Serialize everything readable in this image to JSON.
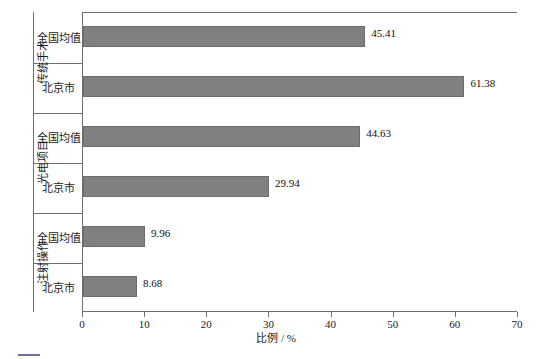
{
  "chart_data": {
    "type": "bar",
    "orientation": "horizontal",
    "title": "",
    "xlabel": "比例 / %",
    "ylabel": "",
    "xlim": [
      0,
      70
    ],
    "xticks": [
      0,
      10,
      20,
      30,
      40,
      50,
      60,
      70
    ],
    "grid": false,
    "legend": "none",
    "bar_color": "#808080",
    "categories": [
      "传统手术",
      "光电项目",
      "注射操作"
    ],
    "subcategories": [
      "全国均值",
      "北京市"
    ],
    "groups": [
      {
        "label": "传统手术",
        "bars": [
          {
            "label": "全国均值",
            "value": 45.41,
            "value_text": "45.41"
          },
          {
            "label": "北京市",
            "value": 61.38,
            "value_text": "61.38"
          }
        ]
      },
      {
        "label": "光电项目",
        "bars": [
          {
            "label": "全国均值",
            "value": 44.63,
            "value_text": "44.63"
          },
          {
            "label": "北京市",
            "value": 29.94,
            "value_text": "29.94"
          }
        ]
      },
      {
        "label": "注射操作",
        "bars": [
          {
            "label": "全国均值",
            "value": 9.96,
            "value_text": "9.96"
          },
          {
            "label": "北京市",
            "value": 8.68,
            "value_text": "8.68"
          }
        ]
      }
    ]
  },
  "caption": {
    "text": ""
  }
}
